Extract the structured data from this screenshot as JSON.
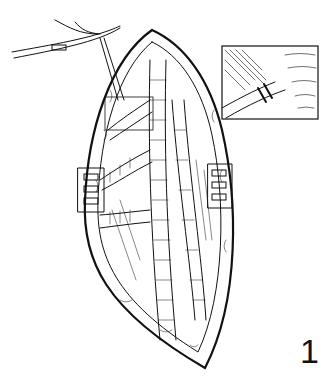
{
  "figure": {
    "number_label": "1",
    "inset": {
      "present": true
    },
    "colors": {
      "line": "#111111",
      "background": "#ffffff"
    }
  }
}
